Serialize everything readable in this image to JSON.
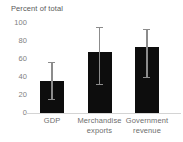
{
  "chart_data": {
    "type": "bar",
    "title": "Percent of total",
    "xlabel": "",
    "ylabel": "",
    "ylim": [
      0,
      100
    ],
    "yticks": [
      0,
      20,
      40,
      60,
      80,
      100
    ],
    "grid": false,
    "legend": false,
    "bar_color": "#0d0d0d",
    "error_color": "#8c8c8c",
    "axis_color": "#d4d4d4",
    "categories": [
      "GDP",
      "Merchandise exports",
      "Government revenue"
    ],
    "category_lines": [
      [
        "GDP"
      ],
      [
        "Merchandise",
        "exports"
      ],
      [
        "Government",
        "revenue"
      ]
    ],
    "values": [
      36,
      68,
      73
    ],
    "error_low": [
      14,
      31,
      39
    ],
    "error_high": [
      57,
      96,
      93
    ],
    "series": [
      {
        "name": "Percent of total",
        "values": [
          36,
          68,
          73
        ]
      }
    ]
  }
}
